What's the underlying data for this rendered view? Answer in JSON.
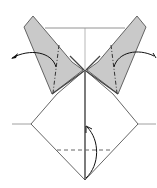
{
  "diagram": {
    "type": "origami-fold-instruction",
    "colors": {
      "background": "#ffffff",
      "paper_back": "#c8c8c8",
      "line": "#555555",
      "fold_line": "#333333",
      "arrow": "#111111",
      "crease": "#999999"
    },
    "elements": {
      "left_flap": "gray flap with mountain-fold dash-dot line",
      "right_flap": "gray flap with mountain-fold dash-dot line",
      "left_arrow": "curved arrow pointing left (unfold)",
      "right_arrow": "curved arrow pointing right (unfold)",
      "bottom_arrow": "curved arrow folding bottom point up",
      "valley_fold_line": "dashed horizontal valley fold",
      "center_crease": "vertical center line",
      "horizontal_creases": "two horizontal reference lines"
    }
  }
}
